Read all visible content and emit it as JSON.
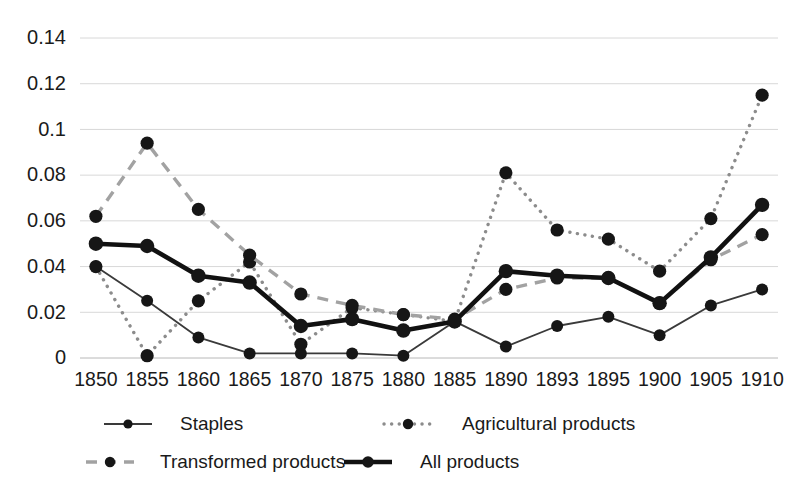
{
  "chart_data": {
    "type": "line",
    "title": "",
    "subtitle": "",
    "xlabel": "",
    "ylabel": "",
    "categories": [
      "1850",
      "1855",
      "1860",
      "1865",
      "1870",
      "1875",
      "1880",
      "1885",
      "1890",
      "1893",
      "1895",
      "1900",
      "1905",
      "1910"
    ],
    "ylim": [
      0,
      0.14
    ],
    "y_ticks": [
      0,
      0.02,
      0.04,
      0.06,
      0.08,
      0.1,
      0.12,
      0.14
    ],
    "y_tick_labels": [
      "0",
      "0.02",
      "0.04",
      "0.06",
      "0.08",
      "0.1",
      "0.12",
      "0.14"
    ],
    "grid": "horizontal",
    "legend_position": "bottom",
    "series": [
      {
        "name": "Staples",
        "style": "solid-thin",
        "color": "#404040",
        "values": [
          0.04,
          0.025,
          0.009,
          0.002,
          0.002,
          0.002,
          0.001,
          0.016,
          0.005,
          0.014,
          0.018,
          0.01,
          0.023,
          0.03
        ]
      },
      {
        "name": "Agricultural products",
        "style": "dotted",
        "color": "#8a8a8a",
        "values": [
          0.04,
          0.001,
          0.025,
          0.042,
          0.006,
          0.022,
          0.019,
          0.016,
          0.081,
          0.056,
          0.052,
          0.038,
          0.061,
          0.115
        ]
      },
      {
        "name": "Transformed products",
        "style": "dashed",
        "color": "#9e9e9e",
        "values": [
          0.062,
          0.094,
          0.065,
          0.045,
          0.028,
          0.023,
          0.019,
          0.017,
          0.03,
          0.035,
          0.035,
          0.024,
          0.043,
          0.054
        ]
      },
      {
        "name": "All products",
        "style": "solid-thick",
        "color": "#121212",
        "values": [
          0.05,
          0.049,
          0.036,
          0.033,
          0.014,
          0.017,
          0.012,
          0.016,
          0.038,
          0.036,
          0.035,
          0.024,
          0.044,
          0.067
        ]
      }
    ],
    "legend_entries": [
      {
        "label": "Staples",
        "style": "solid-thin"
      },
      {
        "label": "Agricultural products",
        "style": "dotted"
      },
      {
        "label": "Transformed products",
        "style": "dashed"
      },
      {
        "label": "All products",
        "style": "solid-thick"
      }
    ],
    "colors": {
      "grid": "#d8d8d8",
      "axis": "#b8b8b8",
      "text": "#1a1a1a",
      "marker": "#1a1a1a",
      "background": "#ffffff"
    }
  },
  "layout": {
    "plot_left": 80,
    "plot_right": 778,
    "plot_top": 38,
    "plot_bottom": 358,
    "legend_rows": [
      {
        "y": 424,
        "items": [
          {
            "x_mark": 128,
            "x_text": 180
          },
          {
            "x_mark": 408,
            "x_text": 462
          }
        ]
      },
      {
        "y": 462,
        "items": [
          {
            "x_mark": 110,
            "x_text": 160
          },
          {
            "x_mark": 368,
            "x_text": 420
          }
        ]
      }
    ]
  }
}
